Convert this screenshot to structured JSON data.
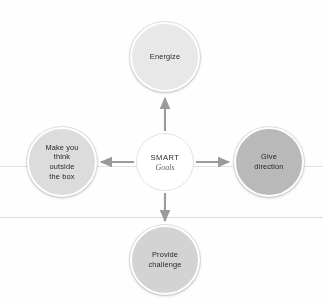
{
  "diagram": {
    "type": "hub-and-spoke",
    "center": {
      "title": "SMART",
      "subtitle": "Goals",
      "fill": "#ffffff"
    },
    "nodes": [
      {
        "id": "energize",
        "position": "top",
        "label": "Energize",
        "lines": [
          "Energize"
        ],
        "fill": "#e8e8e8",
        "arrow": "arrow-up-icon"
      },
      {
        "id": "give-direction",
        "position": "right",
        "label": "Give direction",
        "lines": [
          "Give",
          "direction"
        ],
        "fill": "#b9b9b9",
        "arrow": "arrow-right-icon"
      },
      {
        "id": "provide-challenge",
        "position": "bottom",
        "label": "Provide challenge",
        "lines": [
          "Provide",
          "challenge"
        ],
        "fill": "#d3d3d3",
        "arrow": "arrow-down-icon"
      },
      {
        "id": "think-outside-box",
        "position": "left",
        "label": "Make you think outside the box",
        "lines": [
          "Make you",
          "think",
          "outside",
          "the box"
        ],
        "fill": "#dcdcdc",
        "arrow": "arrow-left-icon"
      }
    ],
    "arrow_color": "#9a9a9a"
  }
}
